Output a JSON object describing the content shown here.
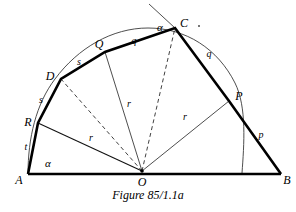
{
  "figure": {
    "caption": "Figure 85/1.1a",
    "stroke_color": "#000000",
    "thin_stroke_color": "#333333",
    "background": "#ffffff"
  },
  "points": {
    "A": {
      "label": "A",
      "x": 28,
      "y": 174,
      "label_x": 19,
      "label_y": 180
    },
    "B": {
      "label": "B",
      "x": 281,
      "y": 174,
      "label_x": 287,
      "label_y": 180
    },
    "O": {
      "label": "O",
      "x": 142,
      "y": 171,
      "label_x": 142,
      "label_y": 181
    },
    "C": {
      "label": "C",
      "x": 175,
      "y": 28,
      "label_x": 184,
      "label_y": 23
    },
    "D": {
      "label": "D",
      "x": 61,
      "y": 79,
      "label_x": 50,
      "label_y": 76
    },
    "P": {
      "label": "P",
      "x": 229,
      "y": 101,
      "label_x": 239,
      "label_y": 96
    },
    "Q": {
      "label": "Q",
      "x": 105,
      "y": 52,
      "label_x": 99,
      "label_y": 44
    },
    "R": {
      "label": "R",
      "x": 38,
      "y": 123,
      "label_x": 28,
      "label_y": 122
    }
  },
  "segment_labels": [
    {
      "name": "t",
      "text": "t",
      "x": 26,
      "y": 147
    },
    {
      "name": "s-lower",
      "text": "s",
      "x": 41,
      "y": 100
    },
    {
      "name": "s-upper",
      "text": "s",
      "x": 79,
      "y": 62
    },
    {
      "name": "q-left",
      "text": "q",
      "x": 134,
      "y": 41
    },
    {
      "name": "q-right",
      "text": "q",
      "x": 209,
      "y": 54
    },
    {
      "name": "p",
      "text": "p",
      "x": 261,
      "y": 135
    },
    {
      "name": "r-left",
      "text": "r",
      "x": 91,
      "y": 138
    },
    {
      "name": "r-middle",
      "text": "r",
      "x": 129,
      "y": 104
    },
    {
      "name": "r-right",
      "text": "r",
      "x": 185,
      "y": 117
    }
  ],
  "angle_labels": [
    {
      "name": "alpha-at-A",
      "text": "α",
      "x": 48,
      "y": 163
    },
    {
      "name": "alpha-at-C",
      "text": "α",
      "x": 160,
      "y": 27
    }
  ],
  "paths": {
    "baseline_AB": "M 28 174 L 281 174",
    "polygon_outline": "M 28 174 L 38 123 L 61 79 L 105 52 L 175 28 L 229 101 L 281 174",
    "inscribed_arc": "M 28 174 C 28 138 36 104 55 79 C 78 48 112 28 148 28 C 186 28 218 49 235 83 C 247 107 244 145 242 173",
    "radius_OR": "M 142 171 L 38 123",
    "radius_OQ": "M 142 171 L 105 52",
    "radius_OP": "M 142 171 L 229 101",
    "radius_OD_dashed": "M 142 171 L 61 79",
    "radius_OC_dashed": "M 142 171 L 175 28",
    "ray_through_C": "M 175 28 L 149 4"
  },
  "decor": {
    "stray_dot_x": 198,
    "stray_dot_y": 25
  }
}
